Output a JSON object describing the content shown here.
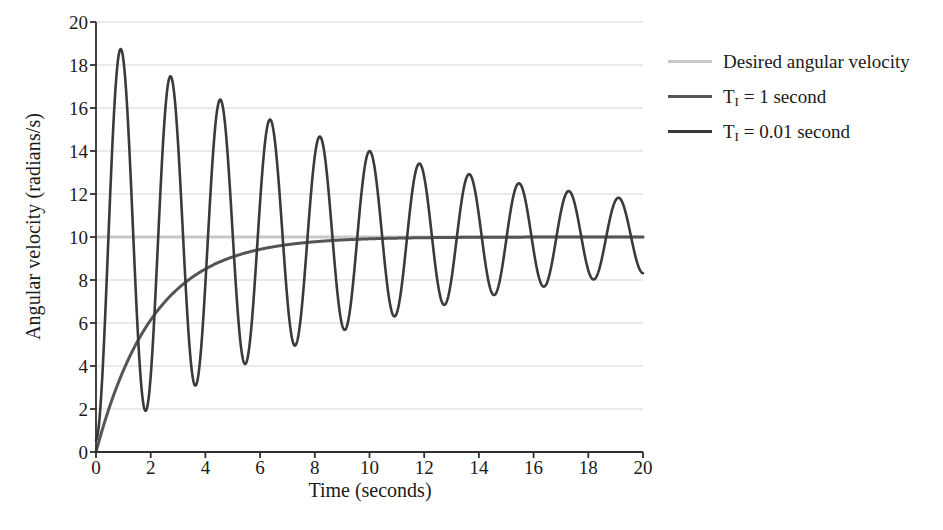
{
  "chart_data": {
    "type": "line",
    "title": "",
    "xlabel": "Time (seconds)",
    "ylabel": "Angular velocity (radians/s)",
    "xlim": [
      0,
      20
    ],
    "ylim": [
      0,
      20
    ],
    "xticks": [
      0,
      2,
      4,
      6,
      8,
      10,
      12,
      14,
      16,
      18,
      20
    ],
    "yticks": [
      0,
      2,
      4,
      6,
      8,
      10,
      12,
      14,
      16,
      18,
      20
    ],
    "grid": "horizontal",
    "legend_position": "right",
    "series": [
      {
        "name": "Desired angular velocity",
        "color": "#c8c8c8",
        "width": 3.0,
        "kind": "constant",
        "value": 10,
        "points": [
          [
            0,
            10
          ],
          [
            20,
            10
          ]
        ]
      },
      {
        "name": "T_I = 1 second",
        "label_base": "T",
        "label_sub": "I",
        "label_rest": " = 1 second",
        "color": "#555555",
        "width": 3.0,
        "kind": "exponential_rise",
        "asymptote": 10,
        "time_constant": 2.1,
        "points": [
          [
            0,
            0
          ],
          [
            0.25,
            2.2
          ],
          [
            0.5,
            3.6
          ],
          [
            0.75,
            4.8
          ],
          [
            1,
            5.8
          ],
          [
            1.5,
            7.1
          ],
          [
            2,
            8.0
          ],
          [
            2.5,
            8.5
          ],
          [
            3,
            8.85
          ],
          [
            4,
            9.25
          ],
          [
            5,
            9.45
          ],
          [
            6,
            9.57
          ],
          [
            7,
            9.64
          ],
          [
            8,
            9.69
          ],
          [
            10,
            9.76
          ],
          [
            12,
            9.82
          ],
          [
            14,
            9.87
          ],
          [
            16,
            9.91
          ],
          [
            18,
            9.95
          ],
          [
            20,
            10.0
          ]
        ]
      },
      {
        "name": "T_I = 0.01 second",
        "label_base": "T",
        "label_sub": "I",
        "label_rest": " = 0.01 second",
        "color": "#3a3a3a",
        "width": 2.6,
        "kind": "damped_oscillation",
        "center": 10,
        "period": 1.82,
        "initial_amplitude": 9.45,
        "decay_per_period": 0.855,
        "peaks": [
          [
            0.95,
            19.4
          ],
          [
            2.8,
            17.9
          ],
          [
            4.65,
            16.7
          ],
          [
            6.5,
            15.65
          ],
          [
            8.35,
            14.8
          ],
          [
            10.2,
            14.1
          ],
          [
            12.0,
            13.5
          ],
          [
            13.85,
            12.95
          ],
          [
            15.7,
            12.5
          ],
          [
            17.5,
            12.1
          ],
          [
            19.4,
            11.75
          ]
        ],
        "troughs": [
          [
            1.95,
            1.25
          ],
          [
            3.8,
            2.6
          ],
          [
            5.65,
            3.8
          ],
          [
            7.5,
            4.7
          ],
          [
            9.35,
            5.5
          ],
          [
            11.2,
            6.2
          ],
          [
            13.05,
            6.75
          ],
          [
            14.9,
            7.2
          ],
          [
            16.75,
            7.6
          ],
          [
            18.6,
            8.0
          ]
        ],
        "start": [
          0,
          0
        ]
      }
    ]
  },
  "legend": {
    "entries": [
      {
        "label": "Desired angular velocity",
        "color": "#c8c8c8"
      },
      {
        "label": "T_I = 1 second",
        "color": "#555555"
      },
      {
        "label": "T_I = 0.01 second",
        "color": "#3a3a3a"
      }
    ]
  },
  "axes": {
    "x_tick_labels": [
      "0",
      "2",
      "4",
      "6",
      "8",
      "10",
      "12",
      "14",
      "16",
      "18",
      "20"
    ],
    "y_tick_labels": [
      "0",
      "2",
      "4",
      "6",
      "8",
      "10",
      "12",
      "14",
      "16",
      "18",
      "20"
    ],
    "x_axis_title": "Time (seconds)",
    "y_axis_title": "Angular velocity (radians/s)"
  },
  "style": {
    "background": "#ffffff",
    "grid_color": "#e3e3e3",
    "axis_color": "#303030",
    "text_color": "#1a1a1a"
  }
}
